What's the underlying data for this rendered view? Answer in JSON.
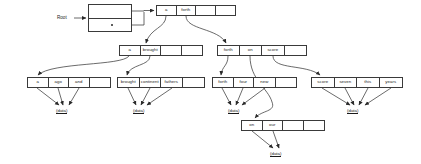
{
  "diagram": {
    "root_label": "Root",
    "data_label": "(data)",
    "stroke_color": "#3a3a3a",
    "text_color": "#1a1a1a",
    "background": "#ffffff",
    "root_node": {
      "name": "root-pointer-box",
      "rows": 2,
      "x": 88,
      "y": 4,
      "w": 44,
      "h": 28
    },
    "nodes": [
      {
        "id": "n-level1",
        "name": "trie-node-level1",
        "x": 156,
        "y": 5,
        "w": 80,
        "h": 11,
        "cells": [
          "a",
          "forth",
          "",
          ""
        ],
        "cell_w": [
          20,
          20,
          20,
          20
        ]
      },
      {
        "id": "n-a-brought",
        "name": "trie-node-a-brought",
        "x": 119,
        "y": 45,
        "w": 84,
        "h": 11,
        "cells": [
          "a",
          "brought",
          "",
          ""
        ],
        "cell_w": [
          21,
          21,
          21,
          21
        ]
      },
      {
        "id": "n-forth-on-score",
        "name": "trie-node-forth-on-score",
        "x": 217,
        "y": 45,
        "w": 90,
        "h": 11,
        "cells": [
          "forth",
          "on",
          "score",
          ""
        ],
        "cell_w": [
          22,
          23,
          23,
          22
        ]
      },
      {
        "id": "n-a-ago-and",
        "name": "trie-node-a-ago-and",
        "x": 27,
        "y": 77,
        "w": 84,
        "h": 11,
        "cells": [
          "a",
          "ago",
          "and",
          ""
        ],
        "cell_w": [
          21,
          21,
          21,
          21
        ]
      },
      {
        "id": "n-brought-continent-fathers",
        "name": "trie-node-brought-continent-fathers",
        "x": 117,
        "y": 77,
        "w": 88,
        "h": 11,
        "cells": [
          "brought",
          "continent",
          "fathers",
          ""
        ],
        "cell_w": [
          22,
          22,
          22,
          22
        ]
      },
      {
        "id": "n-forth-four-new",
        "name": "trie-node-forth-four-new",
        "x": 212,
        "y": 77,
        "w": 85,
        "h": 11,
        "cells": [
          "forth",
          "four",
          "new",
          ""
        ],
        "cell_w": [
          21,
          21,
          22,
          21
        ]
      },
      {
        "id": "n-score-seven-this-years",
        "name": "trie-node-score-seven-this-years",
        "x": 311,
        "y": 77,
        "w": 92,
        "h": 11,
        "cells": [
          "score",
          "seven",
          "this",
          "years"
        ],
        "cell_w": [
          23,
          23,
          23,
          23
        ]
      },
      {
        "id": "n-on-our",
        "name": "trie-node-on-our",
        "x": 241,
        "y": 120,
        "w": 84,
        "h": 11,
        "cells": [
          "on",
          "our",
          "",
          ""
        ],
        "cell_w": [
          21,
          21,
          21,
          21
        ]
      }
    ],
    "data_leaves": [
      {
        "name": "data-leaf-1",
        "x": 56,
        "y": 108
      },
      {
        "name": "data-leaf-2",
        "x": 133,
        "y": 108
      },
      {
        "name": "data-leaf-3",
        "x": 228,
        "y": 108
      },
      {
        "name": "data-leaf-4",
        "x": 347,
        "y": 108
      },
      {
        "name": "data-leaf-5",
        "x": 270,
        "y": 151
      }
    ]
  }
}
